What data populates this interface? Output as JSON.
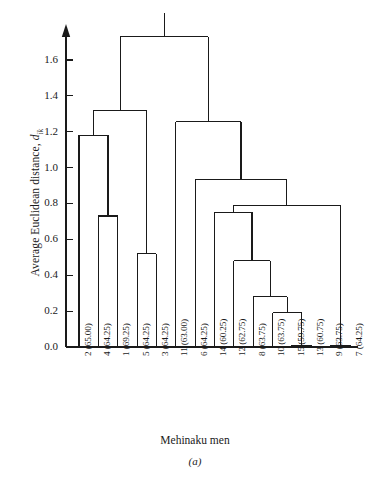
{
  "figure": {
    "caption": "(a)",
    "xtitle": "Mehinaku men",
    "ytitle_main": "Average Euclidean distance, ",
    "ytitle_symbol": "d",
    "ytitle_subscript": "ik",
    "line_color": "#1a1a1a",
    "background": "#ffffff"
  },
  "chart_data": {
    "type": "dendrogram",
    "title": "",
    "subtitle": "",
    "xlabel": "Mehinaku men",
    "ylabel": "Average Euclidean distance, d_ik",
    "grid": false,
    "legend": "none",
    "ylim": [
      0.0,
      1.8
    ],
    "yticks": [
      0.0,
      0.2,
      0.4,
      0.6,
      0.8,
      1.0,
      1.2,
      1.4,
      1.6
    ],
    "ytick_labels": [
      "0.0",
      "0.2",
      "0.4",
      "0.6",
      "0.8",
      "1.0",
      "1.2",
      "1.4",
      "1.6"
    ],
    "leaf_labels": [
      "2 (65.00)",
      "4 (64.25)",
      "1 (69.25)",
      "5 (64.25)",
      "3 (64.25)",
      "11 (63.00)",
      "6 (64.25)",
      "14 (60.25)",
      "12 (62.75)",
      "8 (63.75)",
      "10 (63.75)",
      "15 (59.75)",
      "13 (60.75)",
      "9 (63.75)",
      "7 (64.25)"
    ],
    "leaf_ids": [
      2,
      4,
      1,
      5,
      3,
      11,
      6,
      14,
      12,
      8,
      10,
      15,
      13,
      9,
      7
    ],
    "leaf_values": [
      65.0,
      64.25,
      69.25,
      64.25,
      64.25,
      63.0,
      64.25,
      60.25,
      62.75,
      63.75,
      63.75,
      59.75,
      60.75,
      63.75,
      64.25
    ],
    "merges": [
      {
        "id": "m1",
        "left": "leaf:4",
        "right": "leaf:1",
        "height": 0.73
      },
      {
        "id": "m2",
        "left": "leaf:2",
        "right": "m1",
        "height": 1.18
      },
      {
        "id": "m3",
        "left": "leaf:5",
        "right": "leaf:3",
        "height": 0.52
      },
      {
        "id": "m4",
        "left": "m2",
        "right": "m3",
        "height": 1.32
      },
      {
        "id": "m5",
        "left": "leaf:15",
        "right": "leaf:13",
        "height": 0.01
      },
      {
        "id": "m6",
        "left": "leaf:9",
        "right": "leaf:7",
        "height": 0.01
      },
      {
        "id": "m7",
        "left": "leaf:10",
        "right": "m5",
        "height": 0.19
      },
      {
        "id": "m8",
        "left": "leaf:8",
        "right": "m7",
        "height": 0.28
      },
      {
        "id": "m9",
        "left": "leaf:12",
        "right": "m8",
        "height": 0.48
      },
      {
        "id": "m10",
        "left": "leaf:14",
        "right": "m9",
        "height": 0.75
      },
      {
        "id": "m11",
        "left": "m10",
        "right": "m6",
        "height": 0.79
      },
      {
        "id": "m12",
        "left": "leaf:6",
        "right": "m11",
        "height": 0.935
      },
      {
        "id": "m13",
        "left": "leaf:11",
        "right": "m12",
        "height": 1.255
      },
      {
        "id": "m14",
        "left": "m4",
        "right": "m13",
        "height": 1.73
      }
    ],
    "root_stub_top": 1.86
  }
}
